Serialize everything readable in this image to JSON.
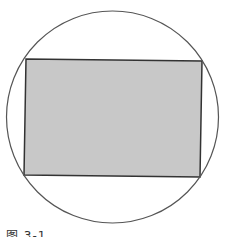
{
  "diagram": {
    "type": "rectangle inscribed in circle",
    "circle": {
      "cx": 112.5,
      "cy": 117,
      "r": 106,
      "stroke": "#555555",
      "stroke_width": 1.2,
      "fill": "none"
    },
    "rectangle": {
      "points": [
        [
          26,
          59
        ],
        [
          202,
          61
        ],
        [
          200,
          177
        ],
        [
          24,
          175
        ]
      ],
      "fill": "#c8c8c8",
      "stroke": "#333333",
      "stroke_width": 1.5
    },
    "background": "#ffffff"
  },
  "caption": {
    "text": "图 3-1",
    "note_clipped": true
  }
}
